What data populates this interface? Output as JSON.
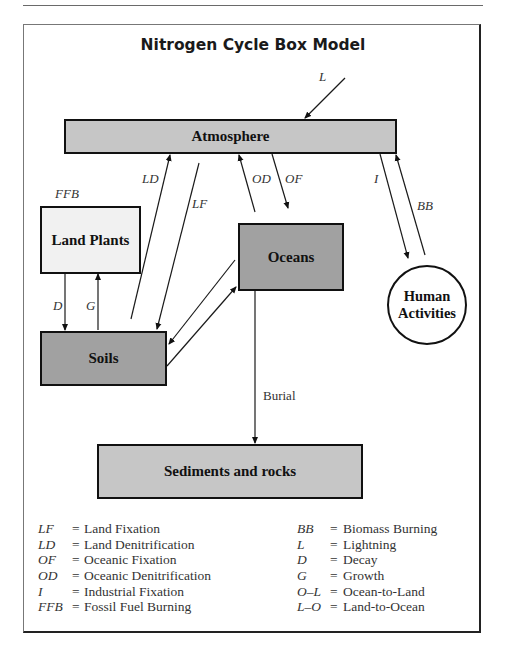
{
  "title": "Nitrogen Cycle Box Model",
  "colors": {
    "atmosphere_fill": "#c6c6c6",
    "sediments_fill": "#c6c6c6",
    "oceans_fill": "#a1a1a1",
    "soils_fill": "#a1a1a1",
    "land_plants_fill": "#f1f1f1",
    "human_activities_fill": "#ffffff",
    "border": "#111111"
  },
  "nodes": {
    "atmosphere": "Atmosphere",
    "land_plants": "Land Plants",
    "oceans": "Oceans",
    "soils": "Soils",
    "human_activities_line1": "Human",
    "human_activities_line2": "Activities",
    "sediments": "Sediments and rocks"
  },
  "flow_labels": {
    "L": "L",
    "LD": "LD",
    "LF": "LF",
    "OD": "OD",
    "OF": "OF",
    "I": "I",
    "BB": "BB",
    "FFB": "FFB",
    "D": "D",
    "G": "G",
    "burial": "Burial"
  },
  "flows": [
    {
      "id": "L",
      "from": "outside",
      "to": "atmosphere"
    },
    {
      "id": "LD",
      "from": "soils",
      "to": "atmosphere"
    },
    {
      "id": "LF",
      "from": "atmosphere",
      "to": "soils"
    },
    {
      "id": "OD",
      "from": "oceans",
      "to": "atmosphere"
    },
    {
      "id": "OF",
      "from": "atmosphere",
      "to": "oceans"
    },
    {
      "id": "I",
      "from": "atmosphere",
      "to": "human_activities"
    },
    {
      "id": "BB",
      "from": "human_activities",
      "to": "atmosphere"
    },
    {
      "id": "D",
      "from": "land_plants",
      "to": "soils"
    },
    {
      "id": "G",
      "from": "soils",
      "to": "land_plants"
    },
    {
      "id": "O-L",
      "from": "oceans",
      "to": "soils"
    },
    {
      "id": "L-O",
      "from": "soils",
      "to": "oceans"
    },
    {
      "id": "Burial",
      "from": "oceans",
      "to": "sediments"
    }
  ],
  "legend": {
    "left": [
      {
        "abbr": "LF",
        "eq": "=",
        "desc": "Land Fixation"
      },
      {
        "abbr": "LD",
        "eq": "=",
        "desc": "Land Denitrification"
      },
      {
        "abbr": "OF",
        "eq": "=",
        "desc": "Oceanic Fixation"
      },
      {
        "abbr": "OD",
        "eq": "=",
        "desc": "Oceanic Denitrification"
      },
      {
        "abbr": "I",
        "eq": "=",
        "desc": "Industrial Fixation"
      },
      {
        "abbr": "FFB",
        "eq": "=",
        "desc": "Fossil Fuel Burning"
      }
    ],
    "right": [
      {
        "abbr": "BB",
        "eq": "=",
        "desc": "Biomass Burning"
      },
      {
        "abbr": "L",
        "eq": "=",
        "desc": "Lightning"
      },
      {
        "abbr": "D",
        "eq": "=",
        "desc": "Decay"
      },
      {
        "abbr": "G",
        "eq": "=",
        "desc": "Growth"
      },
      {
        "abbr": "O–L",
        "eq": "=",
        "desc": "Ocean-to-Land"
      },
      {
        "abbr": "L–O",
        "eq": "=",
        "desc": "Land-to-Ocean"
      }
    ]
  }
}
